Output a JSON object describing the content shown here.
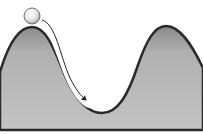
{
  "diagram": {
    "elements": {
      "ball": {
        "label": "",
        "fill": "#e6e6e6"
      },
      "arrow": {
        "label": "",
        "color": "#222222"
      },
      "left_hill": {
        "fill": "#b4b4b4",
        "edge": "#2a2a2a"
      },
      "right_hill": {
        "fill": "#b4b4b4",
        "edge": "#2a2a2a"
      },
      "valley": {
        "fill": "#c0c0c0"
      }
    },
    "colors": {
      "background": "#ffffff",
      "terrain_fill": "#b8b8b8",
      "terrain_edge": "#2a2a2a"
    }
  }
}
